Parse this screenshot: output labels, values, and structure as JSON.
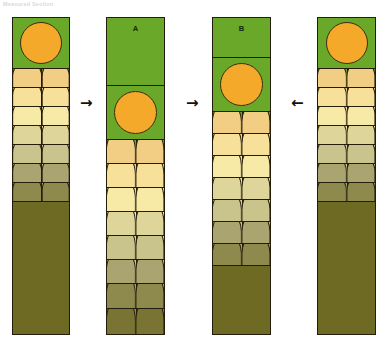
{
  "caption": "Measured Section",
  "figure": {
    "type": "stratigraphic-correlation-diagram",
    "column_count": 4,
    "labels": {
      "column2": "A",
      "column3": "B"
    }
  },
  "palette": {
    "green": "#6aa82a",
    "sun": "#f5a92a",
    "outline": "#241d0c",
    "brown_solid": "#6e6a23",
    "background": "#ffffff",
    "arrow": "#111111",
    "gradient": [
      "#f2cd84",
      "#f7e09a",
      "#f6eaa6",
      "#ded59a",
      "#c9c48c",
      "#a9a470",
      "#8e8a4d",
      "#7a7434"
    ]
  },
  "arrows": [
    {
      "name": "arrow-1",
      "direction": "right",
      "glyph": "→"
    },
    {
      "name": "arrow-2",
      "direction": "right",
      "glyph": "→"
    },
    {
      "name": "arrow-3",
      "direction": "left",
      "glyph": "←"
    }
  ],
  "columns": [
    {
      "id": "column-1",
      "label": "",
      "x": 12,
      "y": 17,
      "width": 58,
      "height": 318,
      "bands": [
        {
          "kind": "sun",
          "height": 51,
          "fill": "#6aa82a",
          "sun_size": 40
        },
        {
          "kind": "dome",
          "height": 19,
          "fill": "#6aa82a",
          "dome_fill": "#f2cd84"
        },
        {
          "kind": "dome",
          "height": 19,
          "fill": "#f2cd84",
          "dome_fill": "#f7e09a"
        },
        {
          "kind": "dome",
          "height": 19,
          "fill": "#f7e09a",
          "dome_fill": "#f6eaa6"
        },
        {
          "kind": "dome",
          "height": 19,
          "fill": "#f6eaa6",
          "dome_fill": "#ded59a"
        },
        {
          "kind": "dome",
          "height": 19,
          "fill": "#ded59a",
          "dome_fill": "#c9c48c"
        },
        {
          "kind": "dome",
          "height": 19,
          "fill": "#c9c48c",
          "dome_fill": "#a9a470"
        },
        {
          "kind": "dome",
          "height": 19,
          "fill": "#a9a470",
          "dome_fill": "#8e8a4d"
        },
        {
          "kind": "solid",
          "height": 134,
          "fill": "#6e6a23"
        }
      ]
    },
    {
      "id": "column-2",
      "label": "A",
      "x": 106,
      "y": 17,
      "width": 59,
      "height": 318,
      "bands": [
        {
          "kind": "label",
          "height": 68,
          "fill": "#6aa82a"
        },
        {
          "kind": "sun",
          "height": 54,
          "fill": "#6aa82a",
          "sun_size": 41
        },
        {
          "kind": "dome",
          "height": 24,
          "fill": "#6aa82a",
          "dome_fill": "#f2cd84"
        },
        {
          "kind": "dome",
          "height": 24,
          "fill": "#f2cd84",
          "dome_fill": "#f7e09a"
        },
        {
          "kind": "dome",
          "height": 24,
          "fill": "#f7e09a",
          "dome_fill": "#f6eaa6"
        },
        {
          "kind": "dome",
          "height": 24,
          "fill": "#f6eaa6",
          "dome_fill": "#ded59a"
        },
        {
          "kind": "dome",
          "height": 24,
          "fill": "#ded59a",
          "dome_fill": "#c9c48c"
        },
        {
          "kind": "dome",
          "height": 24,
          "fill": "#c9c48c",
          "dome_fill": "#a9a470"
        },
        {
          "kind": "dome",
          "height": 25,
          "fill": "#a9a470",
          "dome_fill": "#8e8a4d"
        },
        {
          "kind": "dome",
          "height": 25,
          "fill": "#8e8a4d",
          "dome_fill": "#7a7434"
        }
      ]
    },
    {
      "id": "column-3",
      "label": "B",
      "x": 212,
      "y": 17,
      "width": 59,
      "height": 318,
      "bands": [
        {
          "kind": "label",
          "height": 40,
          "fill": "#6aa82a"
        },
        {
          "kind": "sun",
          "height": 54,
          "fill": "#6aa82a",
          "sun_size": 41
        },
        {
          "kind": "dome",
          "height": 22,
          "fill": "#6aa82a",
          "dome_fill": "#f2cd84"
        },
        {
          "kind": "dome",
          "height": 22,
          "fill": "#f2cd84",
          "dome_fill": "#f7e09a"
        },
        {
          "kind": "dome",
          "height": 22,
          "fill": "#f7e09a",
          "dome_fill": "#f6eaa6"
        },
        {
          "kind": "dome",
          "height": 22,
          "fill": "#f6eaa6",
          "dome_fill": "#ded59a"
        },
        {
          "kind": "dome",
          "height": 22,
          "fill": "#ded59a",
          "dome_fill": "#c9c48c"
        },
        {
          "kind": "dome",
          "height": 22,
          "fill": "#c9c48c",
          "dome_fill": "#a9a470"
        },
        {
          "kind": "dome",
          "height": 22,
          "fill": "#a9a470",
          "dome_fill": "#8e8a4d"
        },
        {
          "kind": "solid",
          "height": 70,
          "fill": "#6e6a23"
        }
      ]
    },
    {
      "id": "column-4",
      "label": "",
      "x": 317,
      "y": 17,
      "width": 59,
      "height": 318,
      "bands": [
        {
          "kind": "sun",
          "height": 51,
          "fill": "#6aa82a",
          "sun_size": 40
        },
        {
          "kind": "dome",
          "height": 19,
          "fill": "#6aa82a",
          "dome_fill": "#f2cd84"
        },
        {
          "kind": "dome",
          "height": 19,
          "fill": "#f2cd84",
          "dome_fill": "#f7e09a"
        },
        {
          "kind": "dome",
          "height": 19,
          "fill": "#f7e09a",
          "dome_fill": "#f6eaa6"
        },
        {
          "kind": "dome",
          "height": 19,
          "fill": "#f6eaa6",
          "dome_fill": "#ded59a"
        },
        {
          "kind": "dome",
          "height": 19,
          "fill": "#ded59a",
          "dome_fill": "#c9c48c"
        },
        {
          "kind": "dome",
          "height": 19,
          "fill": "#c9c48c",
          "dome_fill": "#a9a470"
        },
        {
          "kind": "dome",
          "height": 19,
          "fill": "#a9a470",
          "dome_fill": "#8e8a4d"
        },
        {
          "kind": "solid",
          "height": 134,
          "fill": "#6e6a23"
        }
      ]
    }
  ]
}
